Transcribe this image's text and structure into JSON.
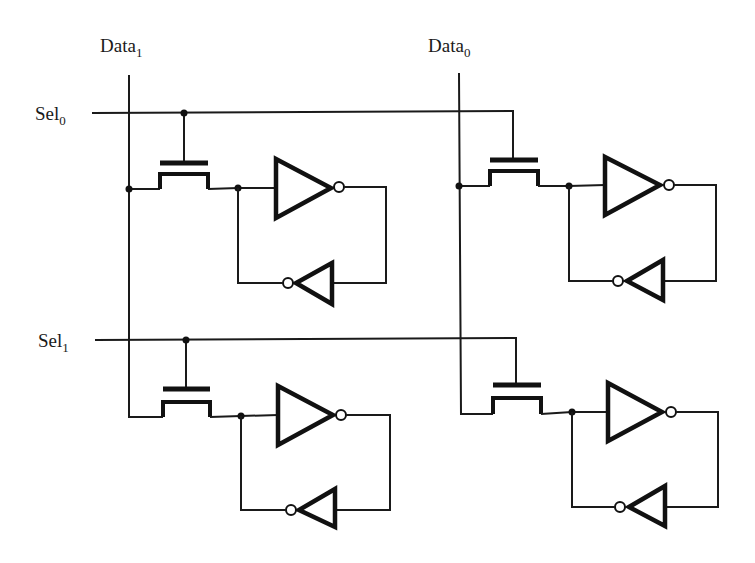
{
  "diagram": {
    "type": "circuit-schematic",
    "colors": {
      "background": "#ffffff",
      "ink": "#1a1a1a"
    },
    "labels": {
      "data1": {
        "base": "Data",
        "sub": "1",
        "x": 100,
        "y": 52
      },
      "data0": {
        "base": "Data",
        "sub": "0",
        "x": 428,
        "y": 52
      },
      "sel0": {
        "base": "Sel",
        "sub": "0",
        "x": 35,
        "y": 120
      },
      "sel1": {
        "base": "Sel",
        "sub": "1",
        "x": 38,
        "y": 347
      }
    },
    "data_lines": [
      {
        "name": "data1",
        "x": 129,
        "y1": 75
      },
      {
        "name": "data0",
        "x": 459,
        "y1": 73
      }
    ],
    "select_lines": [
      {
        "name": "sel0",
        "y": 113,
        "x1": 92
      },
      {
        "name": "sel1",
        "y": 340,
        "x1": 95
      }
    ],
    "cells": [
      {
        "id": "cell-sel0-data1",
        "data_x": 129,
        "sel_y": 113,
        "gate_x": 184,
        "gate_dot": true,
        "tx": {
          "x1": 160,
          "x2": 208,
          "gate_y": 163,
          "chan_y": 174,
          "sd_y": 189
        },
        "data_tap": "dot",
        "node": {
          "x": 238,
          "y": 188
        },
        "inv": {
          "lx": 276,
          "top": 159,
          "bot": 218,
          "tip": 331,
          "y": 188
        },
        "bubble": {
          "x": 339,
          "y": 187
        },
        "loop_x": 386,
        "fb": {
          "base": 332,
          "top": 263,
          "bot": 304,
          "tip": 296,
          "y": 283
        },
        "fb_bubble": {
          "x": 288,
          "y": 283
        }
      },
      {
        "id": "cell-sel0-data0",
        "data_x": 459,
        "sel_y": 111,
        "gate_x": 513,
        "gate_dot": false,
        "tx": {
          "x1": 490,
          "x2": 538,
          "gate_y": 160,
          "chan_y": 171,
          "sd_y": 186
        },
        "data_tap": "dot",
        "node": {
          "x": 569,
          "y": 186
        },
        "inv": {
          "lx": 605,
          "top": 157,
          "bot": 215,
          "tip": 660,
          "y": 185
        },
        "bubble": {
          "x": 669,
          "y": 185
        },
        "loop_x": 716,
        "fb": {
          "base": 663,
          "top": 260,
          "bot": 300,
          "tip": 627,
          "y": 281
        },
        "fb_bubble": {
          "x": 618,
          "y": 281
        }
      },
      {
        "id": "cell-sel1-data1",
        "data_x": 129,
        "sel_y": 340,
        "gate_x": 186,
        "gate_dot": true,
        "tx": {
          "x1": 163,
          "x2": 210,
          "gate_y": 389,
          "chan_y": 402,
          "sd_y": 417
        },
        "data_tap": "corner",
        "node": {
          "x": 241,
          "y": 416
        },
        "inv": {
          "lx": 278,
          "top": 386,
          "bot": 445,
          "tip": 333,
          "y": 415
        },
        "bubble": {
          "x": 341,
          "y": 415
        },
        "loop_x": 390,
        "fb": {
          "base": 335,
          "top": 489,
          "bot": 527,
          "tip": 299,
          "y": 510
        },
        "fb_bubble": {
          "x": 291,
          "y": 510
        }
      },
      {
        "id": "cell-sel1-data0",
        "data_x": 461,
        "sel_y": 338,
        "gate_x": 516,
        "gate_dot": false,
        "tx": {
          "x1": 493,
          "x2": 541,
          "gate_y": 385,
          "chan_y": 398,
          "sd_y": 414
        },
        "data_tap": "corner",
        "node": {
          "x": 572,
          "y": 412
        },
        "inv": {
          "lx": 608,
          "top": 383,
          "bot": 441,
          "tip": 662,
          "y": 412
        },
        "bubble": {
          "x": 671,
          "y": 412
        },
        "loop_x": 718,
        "fb": {
          "base": 665,
          "top": 486,
          "bot": 526,
          "tip": 629,
          "y": 507
        },
        "fb_bubble": {
          "x": 620,
          "y": 507
        }
      }
    ]
  }
}
